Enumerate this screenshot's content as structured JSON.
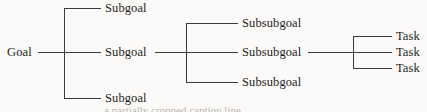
{
  "diagram": {
    "type": "tree",
    "orientation": "left-to-right",
    "colors": {
      "background": "#fbfaf8",
      "line": "#3a3a38",
      "text": "#1c1b19"
    },
    "root": {
      "label": "Goal",
      "x": 7,
      "y": 52
    },
    "levels": [
      {
        "name": "subgoals",
        "label_x": 105,
        "bracket_x": 64,
        "nodes": [
          {
            "label": "Subgoal",
            "y": 8
          },
          {
            "label": "Subgoal",
            "y": 52
          },
          {
            "label": "Subgoal",
            "y": 98
          }
        ]
      },
      {
        "name": "subsubgoals",
        "label_x": 242,
        "bracket_x": 186,
        "nodes": [
          {
            "label": "Subsubgoal",
            "y": 23
          },
          {
            "label": "Subsubgoal",
            "y": 52
          },
          {
            "label": "Subsubgoal",
            "y": 82
          }
        ]
      },
      {
        "name": "tasks",
        "label_x": 396,
        "bracket_x": 353,
        "nodes": [
          {
            "label": "Task",
            "y": 36
          },
          {
            "label": "Task",
            "y": 52
          },
          {
            "label": "Task",
            "y": 68
          }
        ]
      }
    ],
    "caption_fragment": "a partially cropped caption line"
  }
}
